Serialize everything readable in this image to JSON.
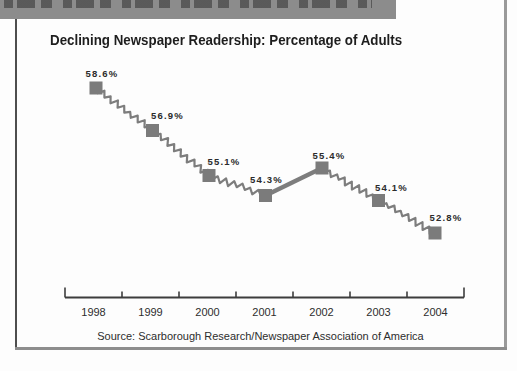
{
  "figure": {
    "title": "Declining Newspaper Readership: Percentage of Adults",
    "source_note": "Source: Scarborough Research/Newspaper Association of America",
    "header_band": {
      "text_visible": false,
      "description": "grey band with text clipped off at top edge of scan"
    }
  },
  "chart_data": {
    "type": "line",
    "title": "Declining Newspaper Readership: Percentage of Adults",
    "x": [
      1998,
      1999,
      2000,
      2001,
      2002,
      2003,
      2004
    ],
    "values": [
      58.6,
      56.9,
      55.1,
      54.3,
      55.4,
      54.1,
      52.8
    ],
    "point_labels": [
      "58.6%",
      "56.9%",
      "55.1%",
      "54.3%",
      "55.4%",
      "54.1%",
      "52.8%"
    ],
    "xlabel": "",
    "ylabel": "",
    "source": "Source: Scarborough Research/Newspaper Association of America",
    "legend": false,
    "grid": false,
    "marker": "square",
    "line_style": "hand-drawn squiggle; straight thick segment between 2001 and 2002",
    "colors": {
      "line": "#7d7d7d",
      "marker": "#7b7b7b",
      "axis": "#3d3d3d",
      "label_text": "#2b2b2b",
      "band": "#8c8c8c"
    }
  }
}
